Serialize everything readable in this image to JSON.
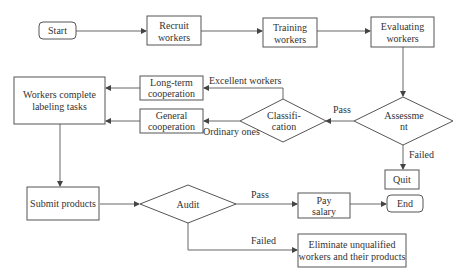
{
  "nodes": {
    "start": "Start",
    "recruit": [
      "Recruit",
      "workers"
    ],
    "training": [
      "Training",
      "workers"
    ],
    "evaluating": [
      "Evaluating",
      "workers"
    ],
    "assessment": [
      "Assessme",
      "nt"
    ],
    "classification": [
      "Classifi-",
      "cation"
    ],
    "long_term": [
      "Long-term",
      "cooperation"
    ],
    "general": [
      "General",
      "cooperation"
    ],
    "workers_complete": [
      "Workers complete",
      "labeling tasks"
    ],
    "quit": "Quit",
    "submit": "Submit products",
    "audit": "Audit",
    "pay_salary": [
      "Pay",
      "salary"
    ],
    "end": "End",
    "eliminate": [
      "Eliminate unqualified",
      "workers and their products"
    ]
  },
  "edge_labels": {
    "pass_assessment": "Pass",
    "failed_assessment": "Failed",
    "excellent": "Excellent workers",
    "ordinary": "Ordinary ones",
    "pass_audit": "Pass",
    "failed_audit": "Failed"
  },
  "colors": {
    "stroke": "#555555",
    "text": "#333333",
    "background": "#ffffff"
  }
}
